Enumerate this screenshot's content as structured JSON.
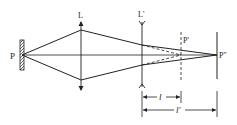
{
  "diagram": {
    "type": "optics-ray-diagram",
    "colors": {
      "line": "#222222",
      "background": "#ffffff"
    },
    "labels": {
      "source": "P",
      "lens1": "L",
      "lens2": "L'",
      "virtual_image": "P'",
      "final_image": "P''",
      "distance_short": "l",
      "distance_long": "l'"
    },
    "elements": [
      {
        "id": "source-P",
        "kind": "object (hatched plate)",
        "x": 20
      },
      {
        "id": "lens-L",
        "kind": "converging lens",
        "x": 81
      },
      {
        "id": "lens-L-prime",
        "kind": "diverging lens",
        "x": 142
      },
      {
        "id": "image-P-prime",
        "kind": "virtual image plane (dashed)",
        "x": 181
      },
      {
        "id": "image-P-double-prime",
        "kind": "screen / final image",
        "x": 217
      }
    ],
    "dimensions": [
      {
        "label": "l",
        "from": "L'",
        "to": "P'"
      },
      {
        "label": "l'",
        "from": "L'",
        "to": "P''"
      }
    ]
  }
}
